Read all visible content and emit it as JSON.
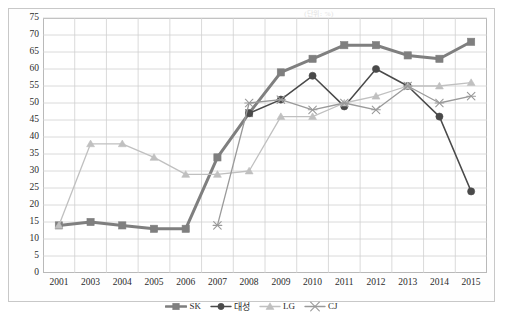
{
  "unit_note": "(단위: %)",
  "chart_data": {
    "type": "line",
    "title": "",
    "subtitle": "",
    "xlabel": "",
    "ylabel": "",
    "ylim": [
      0,
      75
    ],
    "ytick_step": 5,
    "yticks": [
      0,
      5,
      10,
      15,
      20,
      25,
      30,
      35,
      40,
      45,
      50,
      55,
      60,
      65,
      70,
      75
    ],
    "grid": true,
    "legend_position": "bottom",
    "categories": [
      "2001",
      "2003",
      "2004",
      "2005",
      "2006",
      "2007",
      "2008",
      "2009",
      "2010",
      "2011",
      "2012",
      "2013",
      "2014",
      "2015"
    ],
    "series": [
      {
        "name": "SK",
        "color": "#7f7f7f",
        "marker": "square",
        "values": [
          14,
          15,
          14,
          13,
          13,
          34,
          47,
          59,
          63,
          67,
          67,
          64,
          63,
          68
        ]
      },
      {
        "name": "대성",
        "color": "#4a4a4a",
        "marker": "circle",
        "values": [
          null,
          null,
          null,
          null,
          null,
          null,
          47,
          51,
          58,
          49,
          60,
          55,
          46,
          24
        ]
      },
      {
        "name": "LG",
        "color": "#c0c0c0",
        "marker": "triangle",
        "values": [
          14,
          38,
          38,
          34,
          29,
          29,
          30,
          46,
          46,
          50,
          52,
          55,
          55,
          56
        ]
      },
      {
        "name": "CJ",
        "color": "#9a9a9a",
        "marker": "cross",
        "values": [
          null,
          null,
          null,
          null,
          null,
          14,
          50,
          51,
          48,
          50,
          48,
          55,
          50,
          52
        ]
      }
    ]
  },
  "legend": {
    "items": [
      {
        "label": "SK",
        "marker": "square",
        "color": "#7f7f7f"
      },
      {
        "label": "대성",
        "marker": "circle",
        "color": "#4a4a4a"
      },
      {
        "label": "LG",
        "marker": "triangle",
        "color": "#c0c0c0"
      },
      {
        "label": "CJ",
        "marker": "cross",
        "color": "#9a9a9a"
      }
    ]
  }
}
